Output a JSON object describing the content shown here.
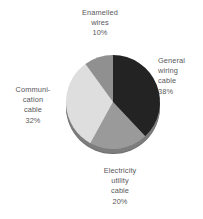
{
  "chart_data": {
    "type": "pie",
    "title": "",
    "subtitle": "",
    "xlabel": "",
    "ylabel": "",
    "grid": false,
    "legend_position": "none",
    "labels_position": "outside",
    "units": "percent",
    "total": 100,
    "categories": [
      "General wiring cable",
      "Electricity utility cable",
      "Communication cable",
      "Enamelled wires"
    ],
    "values": [
      38,
      20,
      32,
      10
    ],
    "slices": [
      {
        "name": "general-wiring-cable",
        "label_lines": [
          "General",
          "wiring",
          "cable",
          "38%"
        ],
        "value": 38,
        "value_text": "38%",
        "color": "#232323",
        "start_angle": 0,
        "end_angle": 136.8
      },
      {
        "name": "electricity-utility-cable",
        "label_lines": [
          "Electricity",
          "utility",
          "cable",
          "20%"
        ],
        "value": 20,
        "value_text": "20%",
        "color": "#9a9a9a",
        "start_angle": 136.8,
        "end_angle": 208.8
      },
      {
        "name": "communication-cable",
        "label_lines": [
          "Communi-",
          "cation",
          "cable",
          "32%"
        ],
        "value": 32,
        "value_text": "32%",
        "color": "#dedede",
        "start_angle": 208.8,
        "end_angle": 324.0
      },
      {
        "name": "enamelled-wires",
        "label_lines": [
          "Enamelled",
          "wires",
          "10%"
        ],
        "value": 10,
        "value_text": "10%",
        "color": "#909090",
        "start_angle": 324.0,
        "end_angle": 360.0
      }
    ],
    "style": {
      "background": "#ffffff",
      "label_color": "#58585a",
      "rim_shadow_color": "#6f6f6f",
      "center_x": 113,
      "center_y": 102,
      "radius": 47,
      "depth": 5
    }
  }
}
